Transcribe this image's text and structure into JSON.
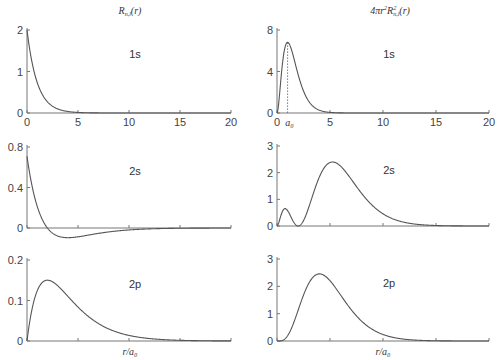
{
  "columns": {
    "left_title": "R_{n,l}(r)",
    "right_title": "4πr²R²_{n,l}(r)"
  },
  "x_axis_label": "r/a₀",
  "a0_marker_label": "a₀",
  "chart_data": [
    {
      "type": "line",
      "id": "R1s",
      "title": "R_{n,l}(r)",
      "panel_label": "1s",
      "xlabel": "",
      "ylabel": "",
      "xlim": [
        0,
        20
      ],
      "ylim": [
        0,
        2
      ],
      "xticks": [
        0,
        5,
        10,
        15,
        20
      ],
      "xtick_labels": [
        "0",
        "5",
        "10",
        "15",
        "20"
      ],
      "yticks": [
        0,
        1,
        2
      ],
      "ytick_labels": [
        "0",
        "1",
        "2"
      ],
      "x": [
        0,
        0.5,
        1,
        1.5,
        2,
        3,
        4,
        5,
        6,
        8,
        10,
        15,
        20
      ],
      "values": [
        2.0,
        1.21,
        0.74,
        0.45,
        0.27,
        0.1,
        0.037,
        0.013,
        0.005,
        0.0007,
        0.0001,
        0,
        0
      ],
      "formula": "2*exp(-r)",
      "grid": false
    },
    {
      "type": "line",
      "id": "P1s",
      "title": "4πr²R²_{n,l}(r)",
      "panel_label": "1s",
      "xlim": [
        0,
        20
      ],
      "ylim": [
        0,
        8
      ],
      "xticks": [
        0,
        5,
        10,
        15,
        20
      ],
      "xtick_labels": [
        "0",
        "5",
        "10",
        "15",
        "20"
      ],
      "yticks": [
        0,
        4,
        8
      ],
      "ytick_labels": [
        "0",
        "4",
        "8"
      ],
      "annotation": {
        "type": "vertical-dotted-line",
        "x": 1,
        "label": "a₀"
      },
      "x": [
        0,
        0.5,
        1,
        1.5,
        2,
        3,
        4,
        5,
        6,
        8,
        10,
        20
      ],
      "values": [
        0,
        4.62,
        6.8,
        5.63,
        3.68,
        1.12,
        0.27,
        0.057,
        0.011,
        0.0003,
        0,
        0
      ],
      "formula": "4*pi*r^2*(2*exp(-r))^2",
      "grid": false
    },
    {
      "type": "line",
      "id": "R2s",
      "title": "",
      "panel_label": "2s",
      "xlim": [
        0,
        20
      ],
      "ylim": [
        -0.05,
        0.8
      ],
      "xticks": [
        0,
        5,
        10,
        15,
        20
      ],
      "xtick_labels": [],
      "yticks": [
        0,
        0.4,
        0.8
      ],
      "ytick_labels": [
        "0",
        "0.4",
        "0.8"
      ],
      "x": [
        0,
        1,
        2,
        3,
        4,
        5,
        6,
        8,
        10,
        12,
        15,
        20
      ],
      "values": [
        0.707,
        0.214,
        0,
        -0.079,
        -0.096,
        -0.087,
        -0.07,
        -0.039,
        -0.019,
        -0.009,
        -0.003,
        0
      ],
      "formula": "(1/(2*sqrt(2)))*(2-r)*exp(-r/2)",
      "grid": false
    },
    {
      "type": "line",
      "id": "P2s",
      "title": "",
      "panel_label": "2s",
      "xlim": [
        0,
        20
      ],
      "ylim": [
        0,
        3
      ],
      "xticks": [
        0,
        5,
        10,
        15,
        20
      ],
      "xtick_labels": [],
      "yticks": [
        0,
        1,
        2,
        3
      ],
      "ytick_labels": [
        "0",
        "1",
        "2",
        "3"
      ],
      "x": [
        0,
        0.76,
        1.5,
        2,
        3,
        4,
        5.24,
        6,
        8,
        10,
        12,
        15,
        20
      ],
      "values": [
        0,
        0.65,
        0.16,
        0,
        0.7,
        1.85,
        2.4,
        2.2,
        1.22,
        0.45,
        0.15,
        0.02,
        0
      ],
      "formula": "4*pi*r^2*((1/(2*sqrt(2)))*(2-r)*exp(-r/2))^2",
      "grid": false
    },
    {
      "type": "line",
      "id": "R2p",
      "title": "",
      "panel_label": "2p",
      "xlabel": "r/a₀",
      "xlim": [
        0,
        20
      ],
      "ylim": [
        0,
        0.2
      ],
      "xticks": [
        0,
        5,
        10,
        15,
        20
      ],
      "xtick_labels": [],
      "yticks": [
        0,
        0.1,
        0.2
      ],
      "ytick_labels": [
        "0",
        "0.1",
        "0.2"
      ],
      "x": [
        0,
        1,
        2,
        3,
        4,
        6,
        8,
        10,
        12,
        15,
        20
      ],
      "values": [
        0,
        0.124,
        0.15,
        0.137,
        0.11,
        0.061,
        0.03,
        0.014,
        0.006,
        0.0011,
        0.0001
      ],
      "formula": "(1/(2*sqrt(6)))*r*exp(-r/2)",
      "grid": false
    },
    {
      "type": "line",
      "id": "P2p",
      "title": "",
      "panel_label": "2p",
      "xlabel": "r/a₀",
      "xlim": [
        0,
        20
      ],
      "ylim": [
        0,
        3
      ],
      "xticks": [
        0,
        5,
        10,
        15,
        20
      ],
      "xtick_labels": [],
      "yticks": [
        0,
        1,
        2,
        3
      ],
      "ytick_labels": [
        "0",
        "1",
        "2",
        "3"
      ],
      "x": [
        0,
        1,
        2,
        3,
        4,
        5,
        6,
        8,
        10,
        12,
        15,
        20
      ],
      "values": [
        0,
        0.19,
        1.13,
        2.12,
        2.45,
        2.15,
        1.64,
        0.68,
        0.24,
        0.08,
        0.008,
        0
      ],
      "formula": "4*pi*r^2*((1/(2*sqrt(6)))*r*exp(-r/2))^2",
      "grid": false
    }
  ]
}
